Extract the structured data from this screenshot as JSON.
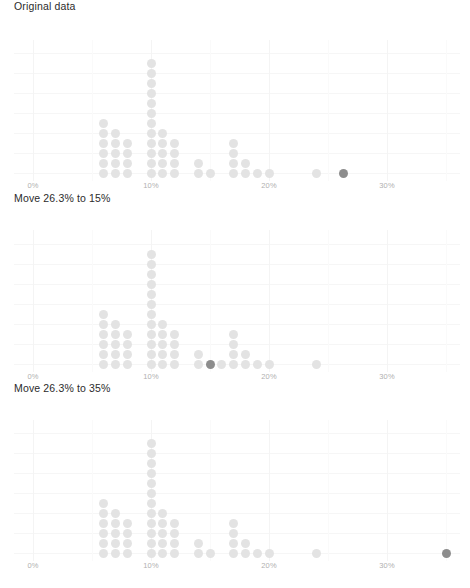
{
  "figure": {
    "background": "#ffffff",
    "dot_color": "#e3e3e3",
    "highlight_color": "#8d8d8d",
    "gridline_color": "#f4f4f4",
    "axis_label_color": "#b0b0b0"
  },
  "panels": [
    {
      "id": "panel-original",
      "title": "Original data",
      "highlight_value": 26.3
    },
    {
      "id": "panel-move-15",
      "title": "Move 26.3% to 15%",
      "highlight_value": 15.0
    },
    {
      "id": "panel-move-35",
      "title": "Move 26.3% to 35%",
      "highlight_value": 35.0
    }
  ],
  "axis": {
    "ticks": [
      {
        "label": "0%",
        "value": 0
      },
      {
        "label": "10%",
        "value": 10
      },
      {
        "label": "20%",
        "value": 20
      },
      {
        "label": "30%",
        "value": 30
      }
    ],
    "xmin": -1.5,
    "xmax": 38
  },
  "chart_data": {
    "type": "dotplot",
    "xlabel": "",
    "ylabel": "count",
    "xlim": [
      -1.5,
      38
    ],
    "grid": true,
    "legend": false,
    "dot_diameter_px": 9,
    "dot_spacing_px": 10,
    "panels": [
      {
        "title": "Original data",
        "highlight_value": 26.3,
        "bins": [
          {
            "x": 6,
            "count": 6
          },
          {
            "x": 7,
            "count": 5
          },
          {
            "x": 8,
            "count": 4
          },
          {
            "x": 10,
            "count": 12
          },
          {
            "x": 11,
            "count": 5
          },
          {
            "x": 12,
            "count": 4
          },
          {
            "x": 14,
            "count": 2
          },
          {
            "x": 15,
            "count": 1
          },
          {
            "x": 17,
            "count": 4
          },
          {
            "x": 18,
            "count": 2
          },
          {
            "x": 19,
            "count": 1
          },
          {
            "x": 20,
            "count": 1
          },
          {
            "x": 24,
            "count": 1
          },
          {
            "x": 26.3,
            "count": 1,
            "highlight": true
          }
        ]
      },
      {
        "title": "Move 26.3% to 15%",
        "highlight_value": 15.0,
        "bins": [
          {
            "x": 6,
            "count": 6
          },
          {
            "x": 7,
            "count": 5
          },
          {
            "x": 8,
            "count": 4
          },
          {
            "x": 10,
            "count": 12
          },
          {
            "x": 11,
            "count": 5
          },
          {
            "x": 12,
            "count": 4
          },
          {
            "x": 14,
            "count": 2
          },
          {
            "x": 15,
            "count": 1,
            "highlight": true
          },
          {
            "x": 16,
            "count": 1
          },
          {
            "x": 17,
            "count": 4
          },
          {
            "x": 18,
            "count": 2
          },
          {
            "x": 19,
            "count": 1
          },
          {
            "x": 20,
            "count": 1
          },
          {
            "x": 24,
            "count": 1
          }
        ]
      },
      {
        "title": "Move 26.3% to 35%",
        "highlight_value": 35.0,
        "bins": [
          {
            "x": 6,
            "count": 6
          },
          {
            "x": 7,
            "count": 5
          },
          {
            "x": 8,
            "count": 4
          },
          {
            "x": 10,
            "count": 12
          },
          {
            "x": 11,
            "count": 5
          },
          {
            "x": 12,
            "count": 4
          },
          {
            "x": 14,
            "count": 2
          },
          {
            "x": 15,
            "count": 1
          },
          {
            "x": 17,
            "count": 4
          },
          {
            "x": 18,
            "count": 2
          },
          {
            "x": 19,
            "count": 1
          },
          {
            "x": 20,
            "count": 1
          },
          {
            "x": 24,
            "count": 1
          },
          {
            "x": 35,
            "count": 1,
            "highlight": true
          }
        ]
      }
    ]
  }
}
